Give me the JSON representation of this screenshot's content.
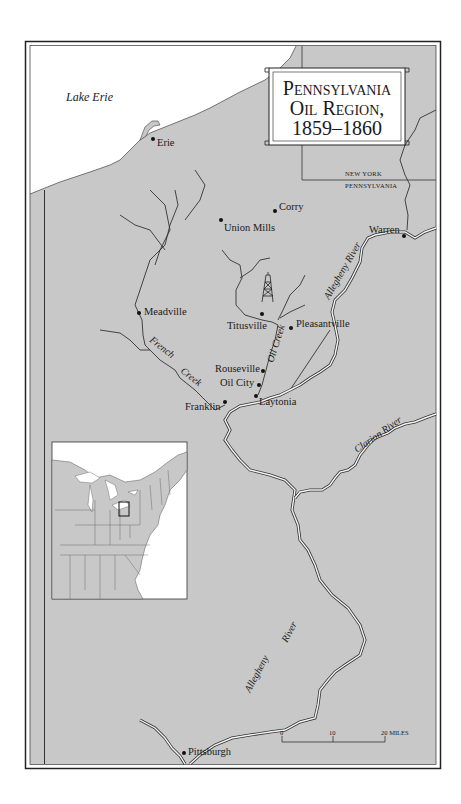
{
  "title": {
    "line1": "Pennsylvania",
    "line2": "Oil Region,",
    "line3": "1859–1860"
  },
  "water": {
    "lake": "Lake Erie"
  },
  "state_labels": {
    "north": "NEW YORK",
    "south": "PENNSYLVANIA"
  },
  "towns": [
    {
      "name": "Erie"
    },
    {
      "name": "Corry"
    },
    {
      "name": "Union Mills"
    },
    {
      "name": "Warren"
    },
    {
      "name": "Meadville"
    },
    {
      "name": "Titusville"
    },
    {
      "name": "Pleasantville"
    },
    {
      "name": "Rouseville"
    },
    {
      "name": "Oil City"
    },
    {
      "name": "Franklin"
    },
    {
      "name": "Laytonia"
    },
    {
      "name": "Pittsburgh"
    }
  ],
  "rivers": {
    "allegheny_upper": "Allegheny River",
    "oil_creek": "Oil Creek",
    "french_creek_1": "French",
    "french_creek_2": "Creek",
    "clarion": "Clarion River",
    "allegheny_lower_1": "Allegheny",
    "allegheny_lower_2": "River"
  },
  "scale": {
    "tick0": "0",
    "tick1": "10",
    "tick2": "20 MILES"
  },
  "icons": {
    "oil_derrick": "oil-derrick-icon",
    "inset": "eastern-us-inset-map"
  },
  "colors": {
    "land": "#c8c8c8",
    "water": "#ffffff",
    "ink": "#1a1a1a",
    "frame": "#222222"
  }
}
